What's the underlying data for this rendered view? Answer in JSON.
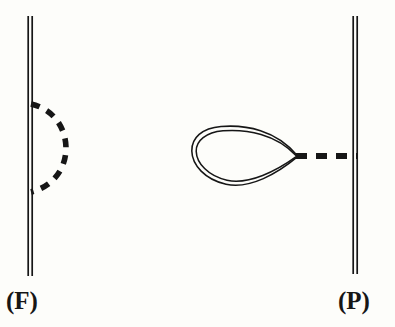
{
  "figure": {
    "width": 395,
    "height": 327,
    "background_color": "#fdfdfa",
    "ink_color": "#161616",
    "type": "feynman-diagram-pair"
  },
  "panels": [
    {
      "id": "F",
      "label": "(F)",
      "label_position": {
        "x": 6,
        "y": 288
      },
      "diagram_kind": "self-energy-loop",
      "propagator": {
        "name": "fermion-double-line",
        "style": "double-solid",
        "x": 30,
        "y_top": 16,
        "y_bottom": 276,
        "line_gap": 4,
        "stroke_width": 1.6
      },
      "interaction": {
        "name": "dashed-semicircle",
        "style": "dashed",
        "stroke_width": 5.5,
        "dash_pattern": "9 8",
        "attach_top": {
          "x": 31,
          "y": 104
        },
        "attach_bottom": {
          "x": 31,
          "y": 192
        },
        "bulge_direction": "right",
        "max_x": 62
      }
    },
    {
      "id": "P",
      "label": "(P)",
      "label_position": {
        "x": 338,
        "y": 288
      },
      "diagram_kind": "tadpole-loop",
      "propagator": {
        "name": "fermion-double-line",
        "style": "double-solid",
        "x": 355,
        "y_top": 16,
        "y_bottom": 274,
        "line_gap": 4,
        "stroke_width": 1.6
      },
      "loop": {
        "name": "teardrop-double-loop",
        "style": "double-solid",
        "stroke_width": 1.5,
        "line_gap": 3.5,
        "cusp": {
          "x": 297,
          "y": 156
        },
        "left_extent": 193,
        "top_extent": 127,
        "bottom_extent": 186
      },
      "interaction": {
        "name": "dashed-connector",
        "style": "dashed",
        "stroke_width": 5.5,
        "dash_pattern": "11 9",
        "from": {
          "x": 297,
          "y": 156
        },
        "to": {
          "x": 356,
          "y": 156
        }
      }
    }
  ]
}
